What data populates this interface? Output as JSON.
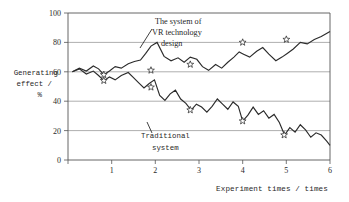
{
  "chart_data": {
    "type": "line",
    "title": "",
    "xlabel": "Experiment times / times",
    "ylabel": "Generating effect / %",
    "ylabel_lines": [
      "Generating",
      "effect /",
      "%"
    ],
    "xlim": [
      0,
      6
    ],
    "ylim": [
      0,
      100
    ],
    "xticks": [
      0,
      1,
      2,
      3,
      4,
      5,
      6
    ],
    "xticklabels": [
      "0",
      "1",
      "2",
      "3",
      "4",
      "5",
      "6"
    ],
    "yticks": [
      0,
      20,
      40,
      60,
      80,
      100
    ],
    "yticklabels": [
      "0",
      "20",
      "40",
      "60",
      "80",
      "100"
    ],
    "grid": "horizontal",
    "legend": "annotations-inline",
    "series": [
      {
        "name": "The system of VR technology design",
        "color": "#2b2b2b",
        "marker": "star",
        "x": [
          0.1,
          0.26,
          0.42,
          0.58,
          0.7,
          0.82,
          0.95,
          1.08,
          1.22,
          1.38,
          1.52,
          1.66,
          1.78,
          1.9,
          2.04,
          2.2,
          2.36,
          2.52,
          2.66,
          2.8,
          2.95,
          3.08,
          3.22,
          3.38,
          3.52,
          3.66,
          3.8,
          3.92,
          4.02,
          4.16,
          4.32,
          4.46,
          4.6,
          4.76,
          4.9,
          5.02,
          5.16,
          5.32,
          5.48,
          5.64,
          5.8,
          6.0
        ],
        "y": [
          60.0,
          62.5,
          60.5,
          64.0,
          62.0,
          58.0,
          60.5,
          63.5,
          62.5,
          65.5,
          67.0,
          68.0,
          72.5,
          77.5,
          80.0,
          70.5,
          67.5,
          69.5,
          66.5,
          70.0,
          68.5,
          63.5,
          61.0,
          65.0,
          62.5,
          66.5,
          70.0,
          73.5,
          72.0,
          70.0,
          74.0,
          76.5,
          72.0,
          67.5,
          70.0,
          72.5,
          75.5,
          80.0,
          79.0,
          82.0,
          84.0,
          87.5
        ],
        "markers": [
          {
            "x": 0.82,
            "y": 58.0
          },
          {
            "x": 1.9,
            "y": 61.0
          },
          {
            "x": 2.8,
            "y": 65.0
          },
          {
            "x": 4.0,
            "y": 80.0
          },
          {
            "x": 5.0,
            "y": 82.0
          }
        ]
      },
      {
        "name": "Traditional system",
        "color": "#2b2b2b",
        "marker": "star",
        "x": [
          0.1,
          0.26,
          0.42,
          0.58,
          0.7,
          0.82,
          0.95,
          1.08,
          1.22,
          1.38,
          1.5,
          1.62,
          1.74,
          1.86,
          1.98,
          2.1,
          2.22,
          2.34,
          2.46,
          2.58,
          2.7,
          2.82,
          2.94,
          3.06,
          3.18,
          3.3,
          3.42,
          3.54,
          3.66,
          3.78,
          3.9,
          4.0,
          4.12,
          4.24,
          4.36,
          4.48,
          4.6,
          4.72,
          4.84,
          4.96,
          5.08,
          5.2,
          5.32,
          5.44,
          5.56,
          5.68,
          5.8,
          5.92,
          6.0
        ],
        "y": [
          60.0,
          62.0,
          58.5,
          60.5,
          57.5,
          54.0,
          56.5,
          54.5,
          57.5,
          59.5,
          56.0,
          52.5,
          49.0,
          52.0,
          54.5,
          44.0,
          40.5,
          45.0,
          47.5,
          41.5,
          38.5,
          34.0,
          38.0,
          36.0,
          32.5,
          36.5,
          41.5,
          38.0,
          34.5,
          39.5,
          36.5,
          26.5,
          30.5,
          36.0,
          31.0,
          33.5,
          28.5,
          31.0,
          25.5,
          17.0,
          22.0,
          19.0,
          24.0,
          20.5,
          15.5,
          18.5,
          17.0,
          13.0,
          10.0
        ],
        "markers": [
          {
            "x": 0.82,
            "y": 54.0
          },
          {
            "x": 1.9,
            "y": 49.5
          },
          {
            "x": 2.8,
            "y": 34.0
          },
          {
            "x": 4.0,
            "y": 26.5
          },
          {
            "x": 4.95,
            "y": 17.0
          }
        ]
      }
    ],
    "annotations": [
      {
        "name": "vr-system-annotation",
        "lines": [
          "The system of",
          "VR technology",
          "design"
        ]
      },
      {
        "name": "traditional-system-annotation",
        "lines": [
          "Traditional",
          "system"
        ]
      }
    ],
    "colors": {
      "line": "#2b2b2b",
      "grid": "#8c8c8c",
      "frame": "#555555",
      "text": "#1f1f1f",
      "background": "#ffffff"
    }
  }
}
